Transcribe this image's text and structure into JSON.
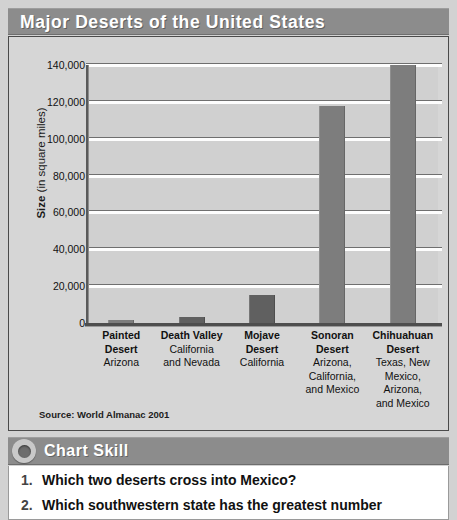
{
  "title": "Major Deserts of the United States",
  "chart_data": {
    "type": "bar",
    "title": "Major Deserts of the United States",
    "xlabel": "",
    "ylabel": "Size (in square miles)",
    "ylabel_bold_part": "Size",
    "ylabel_rest": " (in square miles)",
    "ylim": [
      0,
      140000
    ],
    "ytick_step": 20000,
    "yticks": [
      "0",
      "20,000",
      "40,000",
      "60,000",
      "80,000",
      "100,000",
      "120,000",
      "140,000"
    ],
    "ytick_values": [
      0,
      20000,
      40000,
      60000,
      80000,
      100000,
      120000,
      140000
    ],
    "grid": true,
    "legend": "none",
    "categories": [
      "Painted Desert",
      "Death Valley",
      "Mojave Desert",
      "Sonoran Desert",
      "Chihuahuan Desert"
    ],
    "values": [
      1500,
      3000,
      15000,
      118000,
      140000
    ],
    "bars": [
      {
        "name": "Painted",
        "name2": "Desert",
        "locations": [
          "Arizona"
        ],
        "value": 1500,
        "shade": "light"
      },
      {
        "name": "Death Valley",
        "name2": "",
        "locations": [
          "California",
          "and Nevada"
        ],
        "value": 3000,
        "shade": "dark"
      },
      {
        "name": "Mojave",
        "name2": "Desert",
        "locations": [
          "California"
        ],
        "value": 15000,
        "shade": "dark"
      },
      {
        "name": "Sonoran",
        "name2": "Desert",
        "locations": [
          "Arizona,",
          "California,",
          "and Mexico"
        ],
        "value": 118000,
        "shade": "light"
      },
      {
        "name": "Chihuahuan",
        "name2": "Desert",
        "locations": [
          "Texas, New",
          "Mexico, Arizona,",
          "and Mexico"
        ],
        "value": 140000,
        "shade": "light"
      }
    ],
    "source": "Source: World Almanac 2001"
  },
  "skill": {
    "label": "Chart Skill",
    "icon": "circle-bullet-icon",
    "questions": [
      {
        "number": "1.",
        "text": "Which two deserts cross into Mexico?"
      },
      {
        "number": "2.",
        "text": "Which southwestern state has the greatest number"
      }
    ]
  },
  "colors": {
    "banner": "#8c8c8c",
    "panel_background": "#d6d6d6",
    "bar_light": "#7d7d7d",
    "bar_dark": "#606060",
    "gridline": "#fdfdfd",
    "text": "#111111",
    "banner_text": "#ffffff"
  }
}
